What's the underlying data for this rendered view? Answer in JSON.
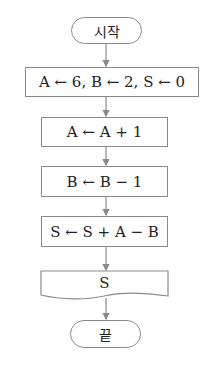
{
  "flowchart": {
    "start": {
      "label": "시작"
    },
    "steps": [
      {
        "label": "A ← 6, B ← 2, S ← 0"
      },
      {
        "label": "A ← A + 1"
      },
      {
        "label": "B ← B − 1"
      },
      {
        "label": "S ← S + A − B"
      }
    ],
    "output": {
      "label": "S"
    },
    "end": {
      "label": "끝"
    }
  },
  "colors": {
    "line": "#8a8a8a",
    "text": "#222222"
  }
}
